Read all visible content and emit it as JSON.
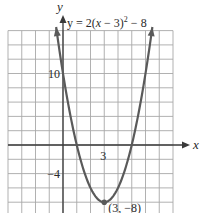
{
  "chart_data": {
    "type": "line",
    "title": "",
    "equation_label": "y = 2(x − 3)² − 8",
    "equation_parts": {
      "prefix": "y = 2(",
      "var": "x",
      "mid": " − 3)",
      "exp": "2",
      "suffix": " − 8"
    },
    "function": {
      "a": 2,
      "h": 3,
      "k": -8
    },
    "series": [
      {
        "name": "y = 2(x − 3)² − 8",
        "x_range": [
          -0.5,
          6.5
        ],
        "color": "#5a5a5a"
      }
    ],
    "xlabel": "x",
    "ylabel": "y",
    "xlim": [
      -4,
      8
    ],
    "ylim": [
      -9.5,
      16
    ],
    "grid": true,
    "grid_step": {
      "x": 1,
      "y": 2
    },
    "x_tick_labels": [
      {
        "value": 3,
        "label": "3"
      }
    ],
    "y_tick_labels": [
      {
        "value": 10,
        "label": "10"
      },
      {
        "value": -4,
        "label": "−4"
      }
    ],
    "annotations": [
      {
        "x": 3,
        "y": -8,
        "label": "(3, −8)",
        "marker": "point"
      }
    ],
    "colors": {
      "grid": "#a8a8a8",
      "axis": "#3a3a3a",
      "curve": "#5a5a5a",
      "vertex": "#5a5a5a"
    }
  }
}
